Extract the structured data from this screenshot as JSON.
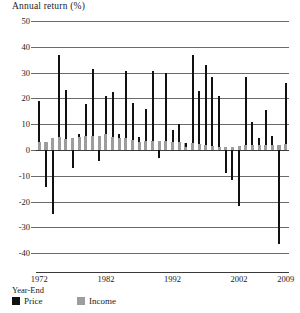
{
  "chart_data": {
    "type": "bar",
    "title": "Annual return (%)",
    "xlabel": "Year-End",
    "ylabel": "Annual return (%)",
    "ylim": [
      -45,
      50
    ],
    "yticks": [
      50,
      40,
      30,
      20,
      10,
      0,
      -10,
      -20,
      -30,
      -40
    ],
    "ytick_labels": [
      "50",
      "40",
      "30",
      "20",
      "10",
      "0",
      "-10",
      "-20",
      "-30",
      "-40"
    ],
    "xtick_labels": [
      "1972",
      "1982",
      "1992",
      "2002",
      "2009"
    ],
    "xticks": [
      1972,
      1982,
      1992,
      2002,
      2009
    ],
    "grid": true,
    "stacked": true,
    "legend_position": "below-left",
    "categories": [
      1972,
      1973,
      1974,
      1975,
      1976,
      1977,
      1978,
      1979,
      1980,
      1981,
      1982,
      1983,
      1984,
      1985,
      1986,
      1987,
      1988,
      1989,
      1990,
      1991,
      1992,
      1993,
      1994,
      1995,
      1996,
      1997,
      1998,
      1999,
      2000,
      2001,
      2002,
      2003,
      2004,
      2005,
      2006,
      2007,
      2008,
      2009
    ],
    "series": [
      {
        "name": "Income",
        "color": "#9d9d9d",
        "values": [
          3.2,
          3.1,
          4.8,
          5.2,
          4.3,
          4.5,
          5.2,
          5.5,
          5.4,
          5.3,
          6.0,
          5.0,
          4.7,
          4.5,
          3.7,
          3.2,
          3.6,
          3.5,
          3.4,
          3.5,
          3.1,
          2.9,
          2.8,
          2.8,
          2.4,
          2.0,
          1.6,
          1.3,
          1.2,
          1.2,
          1.5,
          1.8,
          1.8,
          1.8,
          1.9,
          1.9,
          2.1,
          2.3
        ]
      },
      {
        "name": "Price",
        "color": "#111111",
        "values": [
          15.6,
          -17.4,
          -29.7,
          31.5,
          19.1,
          -11.5,
          1.1,
          12.3,
          25.8,
          -9.7,
          14.8,
          17.3,
          1.4,
          26.3,
          14.6,
          2.0,
          12.4,
          27.3,
          -6.6,
          26.3,
          4.5,
          7.1,
          -1.5,
          34.1,
          20.3,
          31.0,
          26.7,
          19.5,
          -10.1,
          -13.0,
          -23.4,
          26.4,
          9.0,
          3.0,
          13.6,
          3.5,
          -38.5,
          23.5
        ]
      }
    ],
    "totals": [
      7.6,
      -14.7,
      -29.0,
      37.2,
      23.8,
      -7.2,
      6.6,
      18.4,
      32.3,
      -5.0,
      21.4,
      22.5,
      6.3,
      32.2,
      18.5,
      5.2,
      16.8,
      31.5,
      -3.2,
      30.5,
      7.6,
      10.1,
      1.3,
      37.6,
      23.0,
      33.4,
      28.6,
      21.0,
      -9.1,
      -11.9,
      -22.1,
      28.7,
      10.9,
      4.9,
      15.8,
      5.5,
      -37.0,
      26.5
    ]
  },
  "legend": {
    "price_label": "Price",
    "income_label": "Income"
  },
  "axis": {
    "caption": "Year-End"
  }
}
